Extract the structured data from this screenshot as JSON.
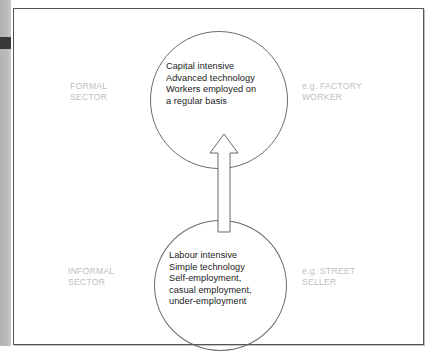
{
  "figure": {
    "type": "two-circle upward-arrow diagram",
    "frame_color": "#555555",
    "circle_color": "#6a6a6a",
    "text_color": "#1a1a1a",
    "label_color": "#c0c0c0"
  },
  "circles": [
    {
      "id": "formal",
      "sector_label": "FORMAL\nSECTOR",
      "example_label": "e.g. FACTORY\nWORKER",
      "body": "Capital intensive\nAdvanced technology\nWorkers employed on\na regular basis",
      "lines": [
        "Capital intensive",
        "Advanced technology",
        "Workers employed on",
        "a regular basis"
      ]
    },
    {
      "id": "informal",
      "sector_label": "INFORMAL\nSECTOR",
      "example_label": "e.g. STREET\nSELLER",
      "body": "Labour intensive\nSimple technology\nSelf-employment,\ncasual employment,\nunder-employment",
      "lines": [
        "Labour intensive",
        "Simple technology",
        "Self-employment,",
        "casual employment,",
        "under-employment"
      ]
    }
  ],
  "arrow": {
    "name": "upward-arrow",
    "direction": "up",
    "meaning": "movement from informal sector to formal sector",
    "style": "outlined white arrow"
  }
}
